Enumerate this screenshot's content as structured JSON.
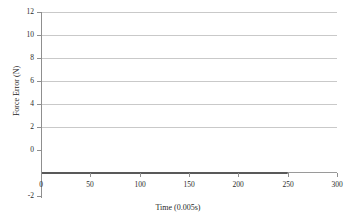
{
  "chart_data": {
    "type": "line",
    "title": "",
    "xlabel": "Time (0.005s)",
    "ylabel": "Force Error (N)",
    "xlim": [
      0,
      300
    ],
    "ylim": [
      -2,
      12
    ],
    "xticks": [
      0,
      50,
      100,
      150,
      200,
      250,
      300
    ],
    "yticks": [
      -2,
      0,
      2,
      4,
      6,
      8,
      10,
      12
    ],
    "grid": "horizontal",
    "legend": "none",
    "series": [
      {
        "name": "Force Error",
        "color": "#595959",
        "x": [
          0,
          10,
          20,
          30,
          40,
          50,
          60,
          70,
          80,
          90,
          100,
          110,
          120,
          130,
          140,
          150,
          160,
          170,
          180,
          190,
          200,
          210,
          220,
          230,
          240,
          250
        ],
        "values": [
          0,
          0,
          0,
          0,
          0,
          0,
          0,
          0,
          0,
          0,
          0,
          0,
          0,
          0,
          0,
          0,
          0,
          0,
          0,
          0,
          0,
          0,
          0,
          0,
          0,
          0
        ]
      }
    ]
  },
  "axis": {
    "y_tick_labels": [
      "12",
      "10",
      "8",
      "6",
      "4",
      "2",
      "0",
      "-2"
    ],
    "x_tick_labels": [
      "0",
      "50",
      "100",
      "150",
      "200",
      "250",
      "300"
    ],
    "x_title": "Time (0.005s)",
    "y_title": "Force Error (N)"
  },
  "colors": {
    "gridline": "#c9c9c9",
    "axis": "#8f8f8f",
    "series": "#595959",
    "background": "#ffffff",
    "text": "#2b2b2b"
  }
}
